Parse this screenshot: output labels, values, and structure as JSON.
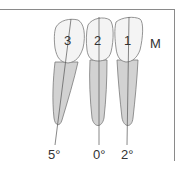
{
  "diagram": {
    "side_label": "M",
    "teeth": [
      {
        "number": "3",
        "angle": "5°"
      },
      {
        "number": "2",
        "angle": "0°"
      },
      {
        "number": "1",
        "angle": "2°"
      }
    ],
    "colors": {
      "crown": "#f4f4f4",
      "root": "#d2d2d2",
      "outline": "#7a7a7a",
      "axis": "#555555",
      "text": "#333333"
    }
  }
}
